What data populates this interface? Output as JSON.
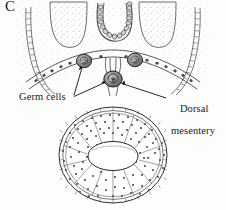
{
  "figure": {
    "panel_letter": "C",
    "caption_labels": {
      "germ_cells": "Germ cells",
      "dorsal_line1": "Dorsal",
      "dorsal_line2": "mesentery"
    },
    "colors": {
      "ink": "#1a1a1a",
      "line": "#3a3a3a",
      "stipple": "#8c8c8c",
      "germ_cell_fill": "#8f8f8f",
      "germ_cell_edge": "#2b2b2b",
      "background": "#fdfdfd",
      "tissue_fill": "#ffffff"
    },
    "structures": [
      {
        "name": "body-wall-left",
        "kind": "segmented-band"
      },
      {
        "name": "body-wall-right",
        "kind": "segmented-band"
      },
      {
        "name": "neural-tube-notochord",
        "kind": "u-shaped-bead-chain"
      },
      {
        "name": "coelomic-lobe-left",
        "kind": "stippled-lobe"
      },
      {
        "name": "coelomic-lobe-right",
        "kind": "stippled-lobe"
      },
      {
        "name": "dorsal-arch-epithelium",
        "kind": "cell-lined-arch"
      },
      {
        "name": "germ-cell-left",
        "kind": "spiral-cell"
      },
      {
        "name": "germ-cell-right",
        "kind": "spiral-cell"
      },
      {
        "name": "germ-cell-mesentery",
        "kind": "spiral-cell"
      },
      {
        "name": "dorsal-mesentery",
        "kind": "stalk"
      },
      {
        "name": "gut-tube",
        "kind": "oval-cross-section"
      },
      {
        "name": "gut-lumen",
        "kind": "oval-void"
      }
    ],
    "leader_lines": [
      {
        "name": "germ-cells-leader-a",
        "from": "germ-cells-label",
        "to": "germ-cell-left"
      },
      {
        "name": "germ-cells-leader-b",
        "from": "germ-cells-label",
        "to": "germ-cell-mesentery"
      },
      {
        "name": "dorsal-mesentery-leader",
        "from": "dorsal-mesentery-label",
        "to": "dorsal-mesentery"
      }
    ]
  }
}
